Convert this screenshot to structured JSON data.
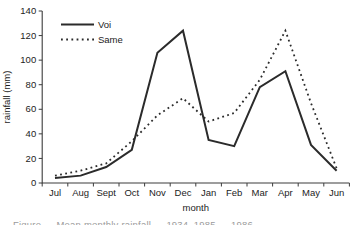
{
  "chart_data": {
    "type": "line",
    "title": "",
    "xlabel": "month",
    "ylabel": "rainfall (mm)",
    "categories": [
      "Jul",
      "Aug",
      "Sept",
      "Oct",
      "Nov",
      "Dec",
      "Jan",
      "Feb",
      "Mar",
      "Apr",
      "May",
      "Jun"
    ],
    "series": [
      {
        "name": "Voi",
        "style": "solid",
        "values": [
          4,
          6,
          13,
          27,
          106,
          124,
          35,
          30,
          78,
          91,
          31,
          10
        ]
      },
      {
        "name": "Same",
        "style": "dashed",
        "values": [
          6,
          10,
          16,
          34,
          55,
          69,
          50,
          57,
          84,
          124,
          65,
          12
        ]
      }
    ],
    "ylim": [
      0,
      140
    ],
    "yticks": [
      0,
      20,
      40,
      60,
      80,
      100,
      120,
      140
    ],
    "grid": false,
    "legend_position": "top-left",
    "line_color": "#2b2b2b",
    "axis_color": "#3c3c3c"
  },
  "caption": {
    "partial_text": "Figure — Mean monthly rainfall … 1934–1985 … 1986",
    "note": "text line clipped at bottom edge of image"
  }
}
